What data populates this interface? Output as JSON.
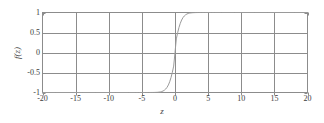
{
  "chart_data": {
    "type": "line",
    "title": "",
    "xlabel": "z",
    "ylabel": "f(z)",
    "xlim": [
      -20,
      20
    ],
    "ylim": [
      -1,
      1
    ],
    "xticks": [
      "-20",
      "-15",
      "-10",
      "-5",
      "0",
      "5",
      "10",
      "15",
      "20"
    ],
    "xtick_values": [
      -20,
      -15,
      -10,
      -5,
      0,
      5,
      10,
      15,
      20
    ],
    "yticks": [
      "1",
      "0.5",
      "0",
      "-0.5",
      "-1"
    ],
    "ytick_values": [
      1,
      0.5,
      0,
      -0.5,
      -1
    ],
    "grid": true,
    "legend": "none",
    "series": [
      {
        "name": "f(z)",
        "color": "#9a9a9a",
        "formula": "tanh",
        "x": [
          -20,
          -18,
          -16,
          -14,
          -12,
          -10,
          -9,
          -8,
          -7,
          -6,
          -5.5,
          -5,
          -4.5,
          -4,
          -3.6,
          -3.2,
          -3,
          -2.8,
          -2.6,
          -2.4,
          -2.2,
          -2,
          -1.8,
          -1.6,
          -1.4,
          -1.2,
          -1,
          -0.8,
          -0.6,
          -0.4,
          -0.2,
          0,
          0.2,
          0.4,
          0.6,
          0.8,
          1,
          1.2,
          1.4,
          1.6,
          1.8,
          2,
          2.2,
          2.4,
          2.6,
          2.8,
          3,
          3.2,
          3.6,
          4,
          4.5,
          5,
          5.5,
          6,
          7,
          8,
          9,
          10,
          12,
          14,
          16,
          18,
          20
        ],
        "y": [
          -1,
          -1,
          -1,
          -1,
          -1,
          -1,
          -1,
          -1,
          -1,
          -1,
          -1,
          -0.9999,
          -0.9999,
          -0.9997,
          -0.9993,
          -0.9984,
          -0.9975,
          -0.9961,
          -0.9938,
          -0.9901,
          -0.9844,
          -0.9757,
          -0.9623,
          -0.9422,
          -0.9128,
          -0.8705,
          -0.8114,
          -0.7312,
          -0.6259,
          -0.4947,
          -0.3401,
          0,
          0.3401,
          0.4947,
          0.6259,
          0.7312,
          0.8114,
          0.8705,
          0.9128,
          0.9422,
          0.9623,
          0.9757,
          0.9844,
          0.9901,
          0.9938,
          0.9961,
          0.9975,
          0.9984,
          0.9993,
          0.9997,
          0.9999,
          0.9999,
          1,
          1,
          1,
          1,
          1,
          1,
          1,
          1,
          1,
          1,
          1
        ]
      }
    ],
    "colors": {
      "curve": "#9a9a9a",
      "grid": "#8c8c8c",
      "axis": "#8c8c8c",
      "text": "#3a3a3a",
      "background": "#ffffff"
    }
  }
}
